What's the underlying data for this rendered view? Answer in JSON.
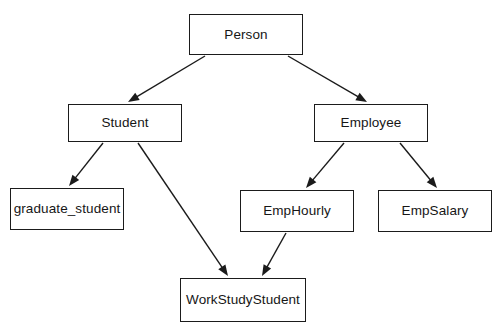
{
  "diagram": {
    "kind": "class-inheritance-hierarchy",
    "width": 500,
    "height": 332,
    "background_color": "#ffffff",
    "line_color": "#1b1b1b",
    "text_color": "#161616",
    "nodes": [
      {
        "id": "person",
        "label": "Person",
        "x": 189,
        "y": 14,
        "w": 114,
        "h": 41
      },
      {
        "id": "student",
        "label": "Student",
        "x": 68,
        "y": 104,
        "w": 114,
        "h": 38
      },
      {
        "id": "employee",
        "label": "Employee",
        "x": 314,
        "y": 104,
        "w": 114,
        "h": 38
      },
      {
        "id": "graduate_student",
        "label": "graduate_student",
        "x": 10,
        "y": 188,
        "w": 114,
        "h": 42
      },
      {
        "id": "emphourly",
        "label": "EmpHourly",
        "x": 240,
        "y": 190,
        "w": 114,
        "h": 42
      },
      {
        "id": "empsalary",
        "label": "EmpSalary",
        "x": 378,
        "y": 190,
        "w": 114,
        "h": 42
      },
      {
        "id": "workstudystudent",
        "label": "WorkStudyStudent",
        "x": 180,
        "y": 278,
        "w": 126,
        "h": 44
      }
    ],
    "edges": [
      {
        "id": "person-student",
        "from": "Person",
        "to": "Student",
        "x1": 205,
        "y1": 56,
        "x2": 128,
        "y2": 102,
        "arrow": "filled-triangle"
      },
      {
        "id": "person-employee",
        "from": "Person",
        "to": "Employee",
        "x1": 288,
        "y1": 56,
        "x2": 367,
        "y2": 102,
        "arrow": "filled-triangle"
      },
      {
        "id": "student-graduate_student",
        "from": "Student",
        "to": "graduate_student",
        "x1": 103,
        "y1": 143,
        "x2": 69,
        "y2": 186,
        "arrow": "filled-triangle"
      },
      {
        "id": "student-workstudystudent",
        "from": "Student",
        "to": "WorkStudyStudent",
        "x1": 138,
        "y1": 143,
        "x2": 228,
        "y2": 276,
        "arrow": "filled-triangle"
      },
      {
        "id": "employee-emphourly",
        "from": "Employee",
        "to": "EmpHourly",
        "x1": 344,
        "y1": 143,
        "x2": 306,
        "y2": 188,
        "arrow": "filled-triangle"
      },
      {
        "id": "employee-empsalary",
        "from": "Employee",
        "to": "EmpSalary",
        "x1": 400,
        "y1": 143,
        "x2": 437,
        "y2": 188,
        "arrow": "filled-triangle"
      },
      {
        "id": "emphourly-workstudystudent",
        "from": "EmpHourly",
        "to": "WorkStudyStudent",
        "x1": 286,
        "y1": 233,
        "x2": 262,
        "y2": 276,
        "arrow": "filled-triangle"
      }
    ]
  }
}
